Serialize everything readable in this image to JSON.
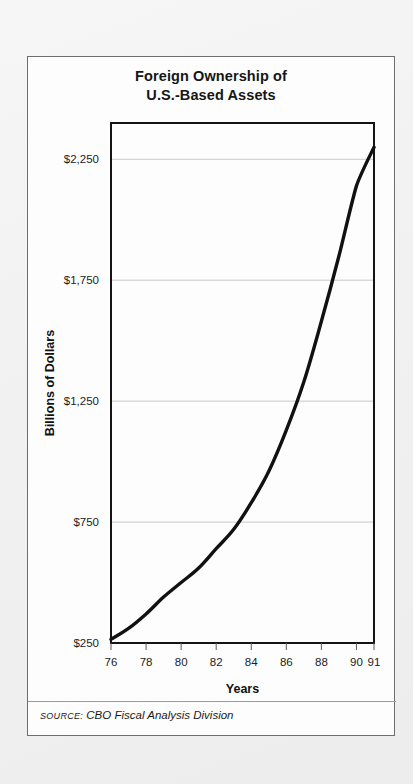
{
  "figure": {
    "title_line1": "Foreign Ownership of",
    "title_line2": "U.S.-Based Assets",
    "source_label": "SOURCE:",
    "source_text": "CBO Fiscal Analysis Division"
  },
  "chart_data": {
    "type": "line",
    "title": "Foreign Ownership of U.S.-Based Assets",
    "xlabel": "Years",
    "ylabel": "Billions of Dollars",
    "xlim": [
      76,
      91
    ],
    "ylim": [
      250,
      2400
    ],
    "grid": true,
    "legend": "none",
    "x_tick_labels": [
      "76",
      "78",
      "80",
      "82",
      "84",
      "86",
      "88",
      "90",
      "91"
    ],
    "x_tick_values": [
      76,
      78,
      80,
      82,
      84,
      86,
      88,
      90,
      91
    ],
    "y_tick_labels": [
      "$2,250",
      "$1,750",
      "$1,250",
      "$750",
      "$250"
    ],
    "y_tick_values": [
      2250,
      1750,
      1250,
      750,
      250
    ],
    "x": [
      76,
      77,
      78,
      79,
      80,
      81,
      82,
      83,
      84,
      85,
      86,
      87,
      88,
      89,
      90,
      91
    ],
    "series": [
      {
        "name": "Foreign ownership of U.S.-based assets",
        "color": "#111111",
        "values": [
          265,
          310,
          370,
          440,
          500,
          560,
          640,
          720,
          830,
          960,
          1130,
          1330,
          1580,
          1850,
          2140,
          2300
        ]
      }
    ]
  }
}
